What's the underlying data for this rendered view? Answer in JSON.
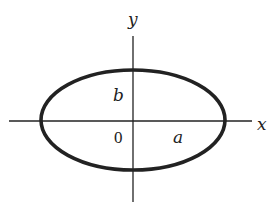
{
  "diagram": {
    "type": "ellipse-on-axes",
    "labels": {
      "x_axis": "x",
      "y_axis": "y",
      "origin": "0",
      "semi_major": "a",
      "semi_minor": "b"
    },
    "colors": {
      "stroke": "#222222",
      "background": "#ffffff"
    }
  }
}
